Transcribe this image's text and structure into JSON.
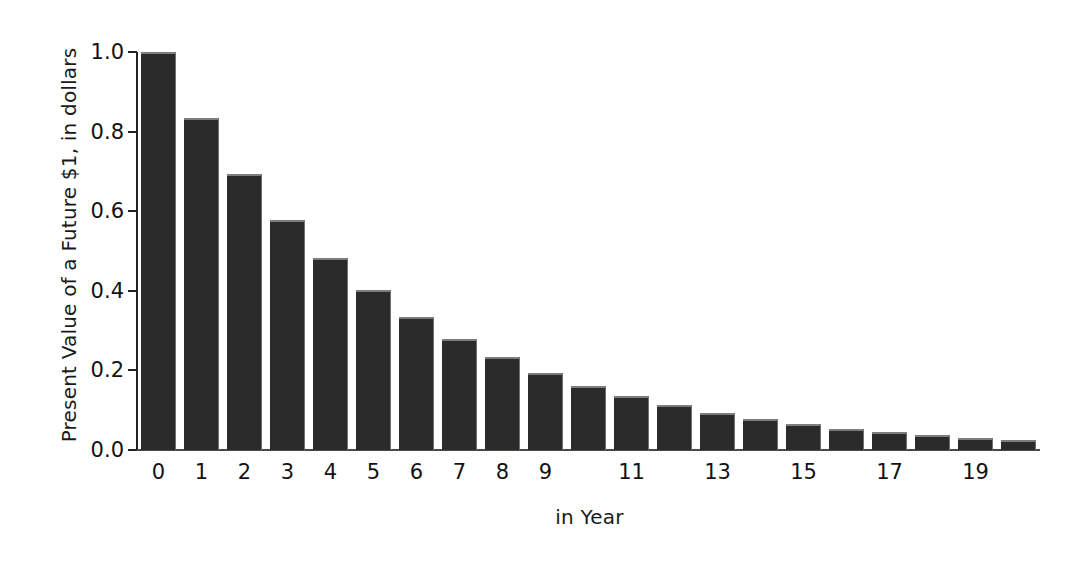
{
  "chart_data": {
    "type": "bar",
    "title": "",
    "xlabel": "in Year",
    "ylabel": "Present Value of a Future $1, in dollars",
    "categories": [
      "0",
      "1",
      "2",
      "3",
      "4",
      "5",
      "6",
      "7",
      "8",
      "9",
      "10",
      "11",
      "12",
      "13",
      "14",
      "15",
      "16",
      "17",
      "18",
      "19",
      "20"
    ],
    "values": [
      1.0,
      0.833,
      0.694,
      0.579,
      0.482,
      0.402,
      0.335,
      0.279,
      0.233,
      0.194,
      0.162,
      0.135,
      0.112,
      0.093,
      0.078,
      0.065,
      0.054,
      0.045,
      0.038,
      0.031,
      0.026
    ],
    "x_tick_labels": [
      "0",
      "1",
      "2",
      "3",
      "4",
      "5",
      "6",
      "7",
      "8",
      "9",
      "",
      "11",
      "",
      "13",
      "",
      "15",
      "",
      "17",
      "",
      "19",
      ""
    ],
    "y_tick_labels": [
      "0.0",
      "0.2",
      "0.4",
      "0.6",
      "0.8",
      "1.0"
    ],
    "y_tick_values": [
      0.0,
      0.2,
      0.4,
      0.6,
      0.8,
      1.0
    ],
    "ylim": [
      0.0,
      1.0
    ],
    "xlim": [
      -0.5,
      20.5
    ],
    "grid": false,
    "legend": null,
    "bar_color": "#2b2b2b",
    "bar_edge_color": "#7e7e7e",
    "background_color": "#ffffff",
    "axis_color": "#222222"
  }
}
